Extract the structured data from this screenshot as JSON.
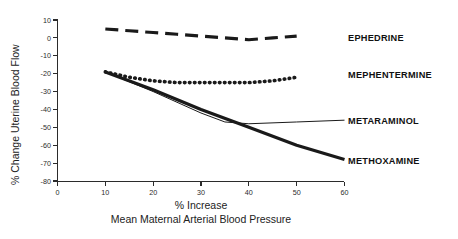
{
  "chart_data": {
    "type": "line",
    "title": "",
    "xlabel": "% Increase Mean Maternal Arterial Blood Pressure",
    "xlabel_line1": "% Increase",
    "xlabel_line2": "Mean Maternal Arterial Blood Pressure",
    "ylabel": "% Change Uterine Blood Flow",
    "xlim": [
      0,
      60
    ],
    "ylim": [
      -80,
      10
    ],
    "xticks": [
      0,
      10,
      20,
      30,
      40,
      50,
      60
    ],
    "xticklabels": [
      "0",
      "10",
      "20",
      "30",
      "40",
      "50",
      "60"
    ],
    "yticks": [
      10,
      0,
      -10,
      -20,
      -30,
      -40,
      -50,
      -60,
      -70,
      -80
    ],
    "yticklabels": [
      "10",
      "0",
      "-10",
      "-20",
      "-30",
      "-40",
      "-50",
      "-60",
      "-70",
      "-80"
    ],
    "grid": false,
    "legend_position": "right-inline-labels",
    "series": [
      {
        "name": "EPHEDRINE",
        "style": "dashed",
        "x": [
          10,
          15,
          20,
          25,
          30,
          35,
          40,
          45,
          50
        ],
        "y": [
          5,
          4,
          3,
          2,
          1,
          0,
          -1,
          0,
          1
        ]
      },
      {
        "name": "MEPHENTERMINE",
        "style": "dotted",
        "x": [
          10,
          15,
          20,
          25,
          30,
          35,
          40,
          45,
          50
        ],
        "y": [
          -19,
          -22,
          -24,
          -25,
          -25,
          -25,
          -25,
          -24,
          -22
        ]
      },
      {
        "name": "METARAMINOL",
        "style": "thin-solid",
        "x": [
          10,
          20,
          30,
          35,
          40,
          50,
          60
        ],
        "y": [
          -19,
          -30,
          -42,
          -47,
          -48,
          -47,
          -46
        ]
      },
      {
        "name": "METHOXAMINE",
        "style": "thick-solid",
        "x": [
          10,
          20,
          30,
          40,
          50,
          60
        ],
        "y": [
          -19,
          -29,
          -40,
          -50,
          -60,
          -68
        ]
      }
    ]
  },
  "axes": {
    "y_axis_label": "% Change Uterine Blood Flow",
    "x_axis_label_line1": "% Increase",
    "x_axis_label_line2": "Mean Maternal Arterial Blood Pressure"
  },
  "legend": {
    "items": [
      {
        "label": "EPHEDRINE"
      },
      {
        "label": "MEPHENTERMINE"
      },
      {
        "label": "METARAMINOL"
      },
      {
        "label": "METHOXAMINE"
      }
    ]
  },
  "colors": {
    "ink": "#1a1a1a",
    "axis": "#2b2b2b",
    "background": "#ffffff"
  }
}
